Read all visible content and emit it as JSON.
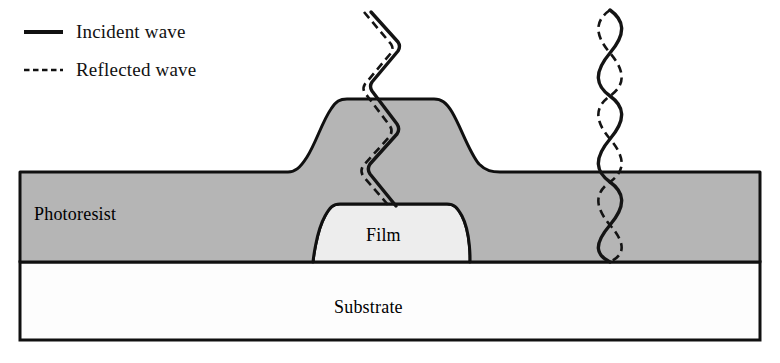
{
  "figure": {
    "width": 780,
    "height": 363
  },
  "legend": {
    "items": [
      {
        "key": "incident",
        "label": "Incident wave",
        "line_style": "solid",
        "color": "#111111"
      },
      {
        "key": "reflected",
        "label": "Reflected wave",
        "line_style": "dashed",
        "color": "#111111"
      }
    ]
  },
  "layers": [
    {
      "key": "photoresist",
      "label": "Photoresist",
      "fill": "#b5b5b5",
      "stroke": "#101010"
    },
    {
      "key": "film",
      "label": "Film",
      "fill": "#ededed",
      "stroke": "#101010"
    },
    {
      "key": "substrate",
      "label": "Substrate",
      "fill": "#fdfdfd",
      "stroke": "#101010"
    }
  ],
  "colors": {
    "photoresist_fill": "#b5b5b5",
    "film_fill": "#ededed",
    "substrate_fill": "#fdfdfd",
    "outline": "#101010",
    "wave": "#141414",
    "background": "#ffffff"
  },
  "geometry": {
    "frame": {
      "left": 20,
      "right": 760,
      "resist_top": 172,
      "resist_bottom": 262,
      "substrate_bottom": 340
    },
    "resist_bump": {
      "top_y": 99,
      "top_left_x": 331,
      "top_right_x": 448,
      "base_left_x": 296,
      "base_right_x": 502
    },
    "film": {
      "top_y": 204,
      "base_y": 262,
      "top_left_x": 337,
      "top_right_x": 450,
      "base_left_x": 313,
      "base_right_x": 470
    }
  },
  "waves": {
    "left": {
      "name": "wave-over-film-step",
      "center_x": 383,
      "start_y": 12,
      "end_y": 206,
      "shape": "zigzag",
      "amplitude": 16,
      "half_period": 48,
      "reflected_offset_x": -6,
      "description": "Incident and reflected waves travel nearly in phase over the raised film step; little interference"
    },
    "right": {
      "name": "standing-wave-over-substrate",
      "center_x": 610,
      "start_y": 10,
      "end_y": 262,
      "shape": "sine",
      "amplitude": 17,
      "half_period": 43,
      "node_spacing": 43,
      "description": "Incident and reflected waves are mirrored, producing nodes and antinodes (standing wave beads)"
    }
  }
}
